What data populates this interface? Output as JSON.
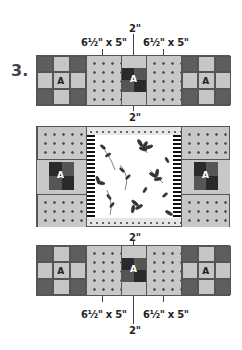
{
  "step_number": "3.",
  "labels": {
    "top_center": "2\"",
    "top_left": "6½\" x 5\"",
    "top_right": "6½\" x 5\"",
    "gap_1": "2\"",
    "gap_2": "2\"",
    "bottom_left": "6½\" x 5\"",
    "bottom_right": "6½\" x 5\"",
    "bottom_center": "2\""
  },
  "blocks": {
    "a_label": "A"
  },
  "colors": {
    "dark_gray": "#5e5e5e",
    "light_gray": "#c6c6c6",
    "darkest": "#2a2a2a",
    "white": "#ffffff"
  }
}
